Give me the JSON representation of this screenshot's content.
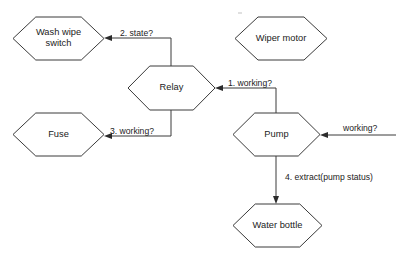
{
  "diagram": {
    "type": "flowchart",
    "background_color": "#ffffff",
    "stroke_color": "#3a3a3a",
    "text_color": "#222222",
    "nodes": [
      {
        "id": "wash-wipe-switch",
        "label": "Wash wipe\nswitch",
        "shape": "hexagon",
        "x": 13,
        "y": 17,
        "w": 91,
        "h": 43
      },
      {
        "id": "wiper-motor",
        "label": "Wiper motor",
        "shape": "hexagon",
        "x": 235,
        "y": 17,
        "w": 92,
        "h": 43
      },
      {
        "id": "relay",
        "label": "Relay",
        "shape": "hexagon",
        "x": 128,
        "y": 66,
        "w": 87,
        "h": 44
      },
      {
        "id": "fuse",
        "label": "Fuse",
        "shape": "hexagon",
        "x": 13,
        "y": 113,
        "w": 91,
        "h": 43
      },
      {
        "id": "pump",
        "label": "Pump",
        "shape": "hexagon",
        "x": 233,
        "y": 113,
        "w": 87,
        "h": 43
      },
      {
        "id": "water-bottle",
        "label": "Water bottle",
        "shape": "hexagon",
        "x": 233,
        "y": 204,
        "w": 89,
        "h": 43
      }
    ],
    "edges": [
      {
        "id": "relay-to-wash-wipe-switch",
        "label": "2. state?",
        "from": "relay",
        "to": "wash-wipe-switch",
        "label_x": 120,
        "label_y": 28
      },
      {
        "id": "pump-to-relay",
        "label": "1. working?",
        "from": "pump",
        "to": "relay",
        "label_x": 228,
        "label_y": 78
      },
      {
        "id": "relay-to-fuse",
        "label": "3. working?",
        "from": "relay",
        "to": "fuse",
        "label_x": 110,
        "label_y": 126
      },
      {
        "id": "external-to-pump",
        "label": "working?",
        "from": "",
        "to": "pump",
        "label_x": 343,
        "label_y": 123
      },
      {
        "id": "pump-to-water-bottle",
        "label": "4. extract(pump status)",
        "from": "pump",
        "to": "water-bottle",
        "label_x": 285,
        "label_y": 172
      }
    ]
  }
}
